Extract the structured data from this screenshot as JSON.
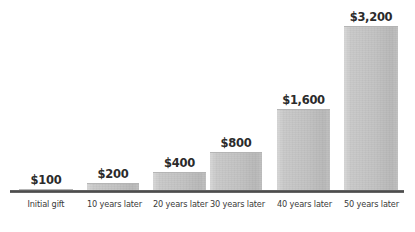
{
  "chart_data": {
    "type": "bar",
    "title": "",
    "subtitle": "",
    "xlabel": "",
    "ylabel": "",
    "grid": false,
    "legend": false,
    "legend_position": "none",
    "ylim": [
      0,
      3200
    ],
    "categories": [
      "Initial gift",
      "10 years later",
      "20 years later",
      "30 years later",
      "40 years later",
      "50 years later"
    ],
    "values": [
      100,
      200,
      400,
      800,
      1600,
      3200
    ],
    "value_labels": [
      "$100",
      "$200",
      "$400",
      "$800",
      "$1,600",
      "$3,200"
    ],
    "bar_color": "#c6c6c6",
    "axis_color": "#4a4a4a",
    "text_color": "#2b2b2b",
    "background": "#ffffff"
  },
  "bars": [
    {
      "label": "Initial gift",
      "value_label": "$100",
      "value": 100,
      "left": 19,
      "width": 54,
      "height": 4
    },
    {
      "label": "10 years later",
      "value_label": "$200",
      "value": 200,
      "left": 87,
      "width": 52,
      "height": 10
    },
    {
      "label": "20 years later",
      "value_label": "$400",
      "value": 400,
      "left": 153,
      "width": 53,
      "height": 21
    },
    {
      "label": "30 years later",
      "value_label": "$800",
      "value": 800,
      "left": 210,
      "width": 52,
      "height": 41
    },
    {
      "label": "40 years later",
      "value_label": "$1,600",
      "value": 1600,
      "left": 277,
      "width": 53,
      "height": 84
    },
    {
      "label": "50 years later",
      "value_label": "$3,200",
      "value": 3200,
      "left": 344,
      "width": 54,
      "height": 167
    }
  ]
}
